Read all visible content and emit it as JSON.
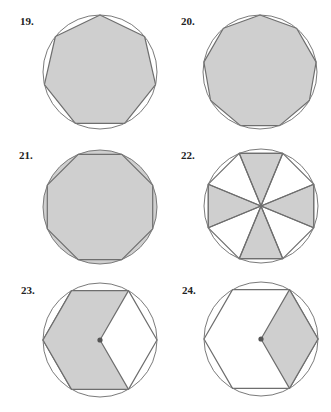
{
  "colors": {
    "shade": "#cfcfcf",
    "stroke": "#6e6e6e",
    "circle": "#7a7a7a",
    "text": "#222222",
    "background": "#ffffff"
  },
  "figures": [
    {
      "number": "19.",
      "shape": "regular heptagon inscribed in circle",
      "sides": 7,
      "shaded_region": "interior of heptagon",
      "center_dot": false
    },
    {
      "number": "20.",
      "shape": "regular nonagon inscribed in circle",
      "sides": 9,
      "shaded_region": "interior of nonagon",
      "center_dot": false
    },
    {
      "number": "21.",
      "shape": "regular octagon inscribed in circle",
      "sides": 8,
      "shaded_region": "circle segments outside octagon",
      "center_dot": false
    },
    {
      "number": "22.",
      "shape": "regular octagon inscribed in circle divided into 8 center triangles",
      "sides": 8,
      "shaded_region": "alternating center triangles (top, right, bottom, left)",
      "center_dot": false
    },
    {
      "number": "23.",
      "shape": "regular hexagon inscribed in circle",
      "sides": 6,
      "shaded_region": "hexagon minus right rhombus",
      "center_dot": true
    },
    {
      "number": "24.",
      "shape": "regular hexagon inscribed in circle",
      "sides": 6,
      "shaded_region": "right rhombus (center to right three vertices)",
      "center_dot": true
    }
  ]
}
